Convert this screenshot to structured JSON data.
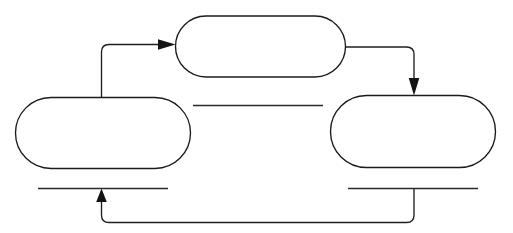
{
  "diagram": {
    "type": "cycle-diagram",
    "background_color": "#ffffff",
    "stroke_color": "#1b1b1b",
    "nodes": [
      {
        "id": "top",
        "label": "",
        "shape": "stadium"
      },
      {
        "id": "left",
        "label": "",
        "shape": "stadium"
      },
      {
        "id": "right",
        "label": "",
        "shape": "stadium"
      }
    ],
    "blank_lines": [
      {
        "id": "middle-blank-line",
        "label": ""
      },
      {
        "id": "left-blank-line",
        "label": ""
      },
      {
        "id": "right-blank-line",
        "label": ""
      }
    ],
    "connectors": [
      {
        "id": "left-to-top",
        "from": "left",
        "to": "top",
        "arrow": true
      },
      {
        "id": "top-to-right",
        "from": "top",
        "to": "right",
        "arrow": true
      },
      {
        "id": "right-to-left",
        "from": "right",
        "to": "left",
        "arrow": true
      }
    ]
  }
}
